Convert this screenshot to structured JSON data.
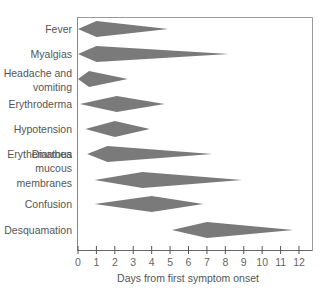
{
  "chart_data": {
    "type": "timeline-diamond",
    "title": "",
    "xlabel": "Days from first symptom onset",
    "ylabel": "",
    "xlim": [
      0,
      12
    ],
    "x_ticks": [
      0,
      1,
      2,
      3,
      4,
      5,
      6,
      7,
      8,
      9,
      10,
      11,
      12
    ],
    "grid": false,
    "legend": null,
    "fill_color": "#7a7a7a",
    "categories": [
      "Fever",
      "Myalgias",
      "Headache and vomiting",
      "Erythroderma",
      "Hypotension",
      "Diarrhea",
      "Erythematous mucous membranes",
      "Confusion",
      "Desquamation"
    ],
    "series": [
      {
        "name": "Fever",
        "label_lines": [
          "Fever"
        ],
        "start": 0.0,
        "peak": 1.0,
        "end": 4.9
      },
      {
        "name": "Myalgias",
        "label_lines": [
          "Myalgias"
        ],
        "start": 0.0,
        "peak": 1.0,
        "end": 8.2
      },
      {
        "name": "Headache and vomiting",
        "label_lines": [
          "Headache and",
          "vomiting"
        ],
        "start": 0.0,
        "peak": 0.6,
        "end": 2.7
      },
      {
        "name": "Erythroderma",
        "label_lines": [
          "Erythroderma"
        ],
        "start": 0.1,
        "peak": 2.1,
        "end": 4.7
      },
      {
        "name": "Hypotension",
        "label_lines": [
          "Hypotension"
        ],
        "start": 0.4,
        "peak": 2.0,
        "end": 3.9
      },
      {
        "name": "Diarrhea",
        "label_lines": [
          "Diarrhea"
        ],
        "start": 0.5,
        "peak": 1.6,
        "end": 7.3
      },
      {
        "name": "Erythematous mucous membranes",
        "label_lines": [
          "Erythematous",
          "mucous",
          "membranes"
        ],
        "start": 0.9,
        "peak": 3.5,
        "end": 8.9
      },
      {
        "name": "Confusion",
        "label_lines": [
          "Confusion"
        ],
        "start": 0.9,
        "peak": 4.0,
        "end": 6.8
      },
      {
        "name": "Desquamation",
        "label_lines": [
          "Desquamation"
        ],
        "start": 5.1,
        "peak": 7.0,
        "end": 11.7
      }
    ]
  },
  "layout": {
    "row_centers_y": [
      29,
      54,
      79,
      104,
      129,
      154,
      180,
      204,
      230
    ],
    "label_y_offsets": [
      [
        0
      ],
      [
        0
      ],
      [
        -6,
        8
      ],
      [
        0
      ],
      [
        0
      ],
      [
        0
      ],
      [
        -26,
        -12,
        3
      ],
      [
        0
      ],
      [
        0
      ]
    ]
  }
}
